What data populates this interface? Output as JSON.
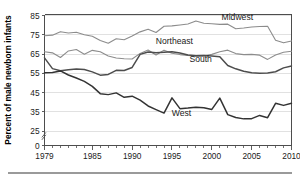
{
  "chart_data": {
    "type": "line",
    "title": "",
    "xlabel": "",
    "ylabel": "Percent of male newborn infants",
    "xlim": [
      1979,
      2010
    ],
    "ylim": [
      25,
      85
    ],
    "y_axis_break": true,
    "y_zero_shown": true,
    "grid": true,
    "grid_axis": "y",
    "legend_position": "inline-annotations",
    "x": [
      1979,
      1980,
      1981,
      1982,
      1983,
      1984,
      1985,
      1986,
      1987,
      1988,
      1989,
      1990,
      1991,
      1992,
      1993,
      1994,
      1995,
      1996,
      1997,
      1998,
      1999,
      2000,
      2001,
      2002,
      2003,
      2004,
      2005,
      2006,
      2007,
      2008,
      2009,
      2010
    ],
    "yticks": [
      0,
      25,
      35,
      45,
      55,
      65,
      75,
      85
    ],
    "yticklabels": [
      "0",
      "25",
      "35",
      "45",
      "55",
      "65",
      "75",
      "85"
    ],
    "xticks": [
      1979,
      1985,
      1990,
      1995,
      2000,
      2005,
      2010
    ],
    "xticklabels": [
      "1979",
      "1985",
      "1990",
      "1995",
      "2000",
      "2005",
      "2010"
    ],
    "series": [
      {
        "name": "Midwest",
        "color": "#8c8c8c",
        "label_x": 2003.2,
        "label_y": 82.5,
        "values": [
          74.5,
          74.8,
          76.6,
          75.9,
          76.3,
          75.0,
          74.2,
          72.0,
          70.6,
          72.9,
          72.4,
          74.3,
          76.5,
          77.9,
          76.2,
          79.4,
          79.6,
          80.1,
          80.6,
          82.1,
          81.0,
          80.7,
          80.4,
          80.5,
          78.1,
          78.5,
          79.0,
          79.3,
          79.4,
          72.1,
          70.8,
          71.8
        ]
      },
      {
        "name": "Northeast",
        "color": "#8c8c8c",
        "label_x": 1995.3,
        "label_y": 70.2,
        "values": [
          66.2,
          65.6,
          63.2,
          66.6,
          67.3,
          64.9,
          66.9,
          66.2,
          64.0,
          62.9,
          62.5,
          62.4,
          65.3,
          67.1,
          64.5,
          67.0,
          65.4,
          64.7,
          64.2,
          63.9,
          64.0,
          64.8,
          66.2,
          67.0,
          65.2,
          64.7,
          64.8,
          64.4,
          62.2,
          64.5,
          65.9,
          66.4
        ]
      },
      {
        "name": "South",
        "color": "#4d4d4d",
        "label_x": 1998.6,
        "label_y": 61.0,
        "values": [
          63.0,
          57.4,
          56.3,
          56.8,
          57.2,
          56.9,
          55.7,
          54.0,
          54.4,
          56.5,
          56.4,
          58.0,
          64.8,
          66.0,
          65.6,
          65.9,
          66.2,
          65.5,
          64.5,
          64.1,
          64.2,
          64.0,
          63.6,
          59.0,
          57.3,
          56.0,
          55.2,
          55.0,
          55.1,
          55.8,
          57.8,
          58.8
        ]
      },
      {
        "name": "West",
        "color": "#333333",
        "label_x": 1996.2,
        "label_y": 32.9,
        "values": [
          55.2,
          55.4,
          56.2,
          54.1,
          52.5,
          50.8,
          48.2,
          44.4,
          43.9,
          44.8,
          42.5,
          43.1,
          41.0,
          38.0,
          36.1,
          34.3,
          42.2,
          36.6,
          36.9,
          37.3,
          37.1,
          36.2,
          42.1,
          33.5,
          32.0,
          31.3,
          31.4,
          33.1,
          31.9,
          39.4,
          38.3,
          39.4
        ]
      }
    ]
  }
}
